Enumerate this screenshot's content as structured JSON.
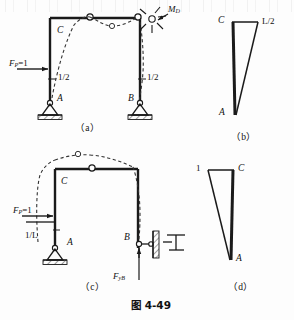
{
  "figure": {
    "caption": "图 4-49",
    "subfigures": [
      {
        "id": "a",
        "label": "（a）"
      },
      {
        "id": "b",
        "label": "（b）"
      },
      {
        "id": "c",
        "label": "（c）"
      },
      {
        "id": "d",
        "label": "（d）"
      }
    ]
  },
  "panel_a": {
    "caption": "（a）",
    "load_label_prefix": "F",
    "load_label_sub": "P",
    "load_label_suffix": "=1",
    "joint_C": "C",
    "joint_A": "A",
    "joint_B": "B",
    "moment_label_prefix": "M",
    "moment_label_sub": "D",
    "ordinate_left": "1/2",
    "ordinate_right": "1/2"
  },
  "panel_b": {
    "caption": "（b）",
    "top_left": "C",
    "top_right": "L/2",
    "bottom": "A"
  },
  "panel_c": {
    "caption": "（c）",
    "load_label_prefix": "F",
    "load_label_sub": "P",
    "load_label_suffix": "=1",
    "joint_C": "C",
    "joint_A": "A",
    "joint_B": "B",
    "ordinate_left": "1/L",
    "reaction_prefix": "F",
    "reaction_sub": "yB"
  },
  "panel_d": {
    "caption": "（d）",
    "top_left": "1",
    "top_right": "C",
    "bottom": "A"
  },
  "colors": {
    "line": "#1a1a1a",
    "dashed": "#333333",
    "hatch": "#555555",
    "background": "#fdfdfd"
  }
}
